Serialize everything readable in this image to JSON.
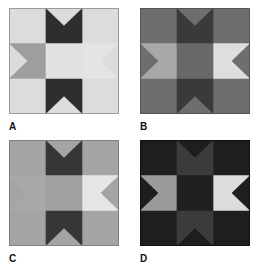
{
  "figure": {
    "panels": [
      {
        "id": "A",
        "label": "A",
        "colors": {
          "background": "#dcdcdc",
          "center": "#e2e2e2",
          "top": "#2e2e2e",
          "bottom": "#2e2e2e",
          "left": "#9e9e9e",
          "right": "#e4e4e4",
          "border": "#9a9a9a"
        }
      },
      {
        "id": "B",
        "label": "B",
        "colors": {
          "background": "#6e6e6e",
          "center": "#686868",
          "top": "#3a3a3a",
          "bottom": "#3a3a3a",
          "left": "#a8a8a8",
          "right": "#dedede",
          "border": "#555555"
        }
      },
      {
        "id": "C",
        "label": "C",
        "colors": {
          "background": "#a4a4a4",
          "center": "#a0a0a0",
          "top": "#363636",
          "bottom": "#363636",
          "left": "#a8a8a8",
          "right": "#e6e6e6",
          "border": "#808080"
        }
      },
      {
        "id": "D",
        "label": "D",
        "colors": {
          "background": "#1e1e1e",
          "center": "#202020",
          "top": "#3c3c3c",
          "bottom": "#3c3c3c",
          "left": "#9a9a9a",
          "right": "#dcdcdc",
          "border": "#111111"
        }
      }
    ]
  }
}
